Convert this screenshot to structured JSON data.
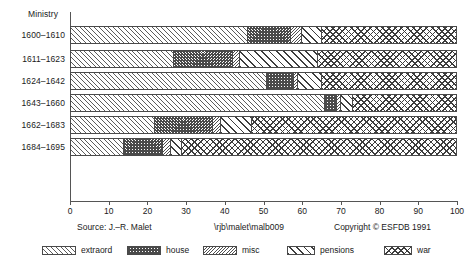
{
  "chart_data": {
    "type": "bar",
    "orientation": "horizontal",
    "stacked": true,
    "normalized_percent": true,
    "title": "",
    "ylabel": "Ministry",
    "xlabel": "",
    "xlim": [
      0,
      100
    ],
    "xticks": [
      "0",
      "10",
      "20",
      "30",
      "40",
      "50",
      "60",
      "70",
      "80",
      "90",
      "100"
    ],
    "grid": false,
    "legend_position": "bottom",
    "categories": [
      "1600–1610",
      "1611–1623",
      "1624–1642",
      "1643–1660",
      "1662–1683",
      "1684–1695"
    ],
    "series": [
      {
        "name": "extraord",
        "pattern": "forward-hatch-fine",
        "values": [
          46,
          27,
          51,
          66,
          22,
          14
        ]
      },
      {
        "name": "house",
        "pattern": "crosshatch-fine",
        "values": [
          11,
          15,
          7,
          3,
          15,
          10
        ]
      },
      {
        "name": "misc",
        "pattern": "back-hatch-fine",
        "values": [
          3,
          2,
          1,
          1,
          2,
          2
        ]
      },
      {
        "name": "pensions",
        "pattern": "forward-hatch-wide",
        "values": [
          5,
          20,
          6,
          3,
          8,
          3
        ]
      },
      {
        "name": "war",
        "pattern": "crosshatch-wide",
        "values": [
          35,
          36,
          35,
          27,
          53,
          71
        ]
      }
    ]
  },
  "axis": {
    "ministry_label": "Ministry"
  },
  "footer": {
    "source": "Source: J.–R. Malet",
    "path": "\\rjb\\malet\\malb009",
    "copyright": "Copyright © ESFDB 1991"
  },
  "legend": {
    "items": [
      {
        "label": "extraord"
      },
      {
        "label": "house"
      },
      {
        "label": "misc"
      },
      {
        "label": "pensions"
      },
      {
        "label": "war"
      }
    ]
  },
  "colors": {
    "ink": "#1a1a1a",
    "axis": "#555555",
    "hatch": "#4a4a4a",
    "background": "#ffffff"
  }
}
